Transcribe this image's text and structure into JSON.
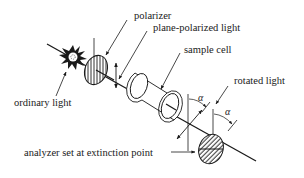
{
  "diagram": {
    "colors": {
      "ink": "#1a1a1a",
      "background": "#ffffff"
    },
    "labels": {
      "polarizer": "polarizer",
      "plane_polarized_light": "plane-polarized light",
      "sample_cell": "sample cell",
      "rotated_light": "rotated light",
      "ordinary_light": "ordinary light",
      "analyzer": "analyzer set at extinction point"
    },
    "angles": {
      "alpha_1": "α",
      "alpha_2": "α"
    },
    "components": [
      {
        "id": "light-source",
        "label": "ordinary light"
      },
      {
        "id": "polarizer",
        "label": "polarizer"
      },
      {
        "id": "plane-polarized-light",
        "label": "plane-polarized light"
      },
      {
        "id": "sample-cell",
        "label": "sample cell"
      },
      {
        "id": "rotated-light",
        "label": "rotated light"
      },
      {
        "id": "analyzer",
        "label": "analyzer set at extinction point"
      }
    ]
  }
}
